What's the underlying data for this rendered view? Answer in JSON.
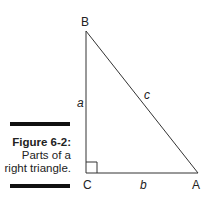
{
  "figure": {
    "number": "Figure 6-2:",
    "caption_lines": [
      "Parts of a",
      "right triangle."
    ]
  },
  "diagram": {
    "vertices": {
      "B": "B",
      "C": "C",
      "A": "A"
    },
    "sides": {
      "a": "a",
      "b": "b",
      "c": "c"
    },
    "right_angle_at": "C"
  }
}
